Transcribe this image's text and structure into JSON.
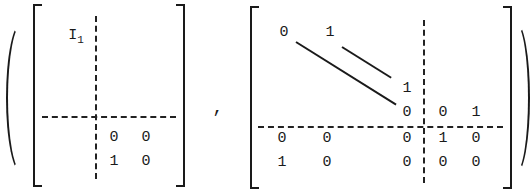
{
  "expression": {
    "left_paren": "(",
    "right_paren": ")",
    "separator": ",",
    "matrix_a": {
      "top_left_block": {
        "symbol": "I",
        "subscript": "1"
      },
      "bottom_right_block": [
        [
          "0",
          "0"
        ],
        [
          "1",
          "0"
        ]
      ]
    },
    "matrix_b": {
      "top_left_block": {
        "first_row": [
          "0",
          "1"
        ],
        "diagonal_ends": [
          "1",
          "0"
        ],
        "description": "shift matrix: 0 on main diagonal, 1 on superdiagonal"
      },
      "top_right_block": [
        [
          "0",
          "1"
        ]
      ],
      "bottom_left_block": [
        [
          "0",
          "0",
          "0"
        ],
        [
          "1",
          "0",
          "0"
        ]
      ],
      "bottom_right_block": [
        [
          "1",
          "0"
        ],
        [
          "0",
          "0"
        ]
      ]
    }
  }
}
